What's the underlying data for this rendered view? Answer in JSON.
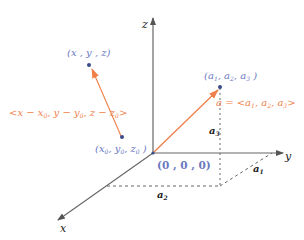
{
  "diagram": {
    "axes": {
      "x_label": "x",
      "y_label": "y",
      "z_label": "z",
      "origin_label": "(0 , 0 , 0)"
    },
    "points": {
      "general_point": "(x , y , z)",
      "initial_point": {
        "prefix": "(x",
        "s1": "0",
        "m1": ", y",
        "s2": "0",
        "m2": ", z",
        "s3": "0",
        "suffix": " )"
      },
      "vector_tip": {
        "prefix": "(a",
        "s1": "1",
        "m1": ", a",
        "s2": "2",
        "m2": ", a",
        "s3": "3",
        "suffix": " )"
      }
    },
    "vectors": {
      "displacement_label": {
        "prefix": "<x − x",
        "s1": "0",
        "m1": ", y − y",
        "s2": "0",
        "m2": ", z − z",
        "s3": "0",
        "suffix": ">"
      },
      "position_label": {
        "prefix": "a = <a",
        "s1": "1",
        "m1": ", a",
        "s2": "2",
        "m2": ", a",
        "s3": "3",
        "suffix": ">"
      }
    },
    "components": {
      "a1": {
        "base": "a",
        "sub": "1"
      },
      "a2": {
        "base": "a",
        "sub": "2"
      },
      "a3": {
        "base": "a",
        "sub": "3"
      }
    },
    "colors": {
      "axis": "#555555",
      "vector": "#f0804a",
      "point": "#3a4a8a",
      "point_label": "#6a78c0",
      "vector_label": "#f0804a",
      "dashed": "#555555"
    }
  }
}
